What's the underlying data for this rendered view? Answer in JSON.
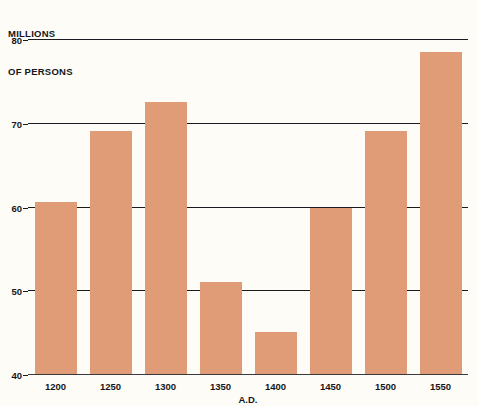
{
  "chart_data": {
    "type": "bar",
    "title": "",
    "subtitle": "",
    "xlabel": "A.D.",
    "ylabel": "MILLIONS OF PERSONS",
    "ylabel_lines": [
      "MILLIONS",
      "OF PERSONS"
    ],
    "categories": [
      "1200",
      "1250",
      "1300",
      "1350",
      "1400",
      "1450",
      "1500",
      "1550"
    ],
    "values": [
      60.5,
      69,
      72.5,
      51,
      45,
      59.8,
      69,
      78.5
    ],
    "ylim": [
      40,
      80
    ],
    "yticks": [
      40,
      50,
      60,
      70,
      80
    ],
    "ytick_labels": [
      "40",
      "50",
      "60",
      "70",
      "80"
    ],
    "grid": true,
    "grid_axis": "y",
    "legend": false,
    "legend_position": "none",
    "bar_color": "#e09b77",
    "gridline_color": "#1b1b1f",
    "background_color": "#fdfcf7",
    "text_color": "#16161a"
  }
}
